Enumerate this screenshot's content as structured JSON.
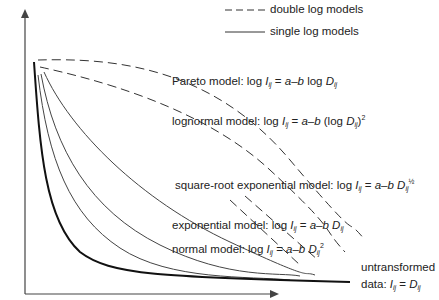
{
  "legend": {
    "double_log": "double log models",
    "single_log": "single log models"
  },
  "axes": {
    "ylabel_prefix": "interaction (",
    "ylabel_var": "I",
    "ylabel_sub": "ij",
    "ylabel_suffix": ")"
  },
  "models": [
    {
      "name": "Pareto model: log ",
      "var": "I",
      "sub": "ij",
      "eq": " = ",
      "rhs": "a–b",
      "rest": " log ",
      "dvar": "D",
      "dsub": "ij",
      "tail": "",
      "sup": "",
      "style": "dashed"
    },
    {
      "name": "lognormal model: log ",
      "var": "I",
      "sub": "ij",
      "eq": " = ",
      "rhs": "a–b",
      "rest": " (log ",
      "dvar": "D",
      "dsub": "ij",
      "tail": ")",
      "sup": "2",
      "style": "dashed"
    },
    {
      "name": "square-root exponential model: log ",
      "var": "I",
      "sub": "ij",
      "eq": " = ",
      "rhs": "a–b",
      "rest": " ",
      "dvar": "D",
      "dsub": "ij",
      "tail": "",
      "sup": "½",
      "style": "solid"
    },
    {
      "name": "exponential model: log ",
      "var": "I",
      "sub": "ij",
      "eq": " = ",
      "rhs": "a–b",
      "rest": " ",
      "dvar": "D",
      "dsub": "ij",
      "tail": "",
      "sup": "",
      "style": "solid"
    },
    {
      "name": "normal model: log ",
      "var": "I",
      "sub": "ij",
      "eq": " = ",
      "rhs": "a–b",
      "rest": " ",
      "dvar": "D",
      "dsub": "ij",
      "tail": "",
      "sup": "2",
      "style": "solid"
    }
  ],
  "untransformed": {
    "line1": "untransformed",
    "line2": "data: ",
    "var": "I",
    "sub": "ij",
    "eq": " = ",
    "dvar": "D",
    "dsub": "ij"
  }
}
